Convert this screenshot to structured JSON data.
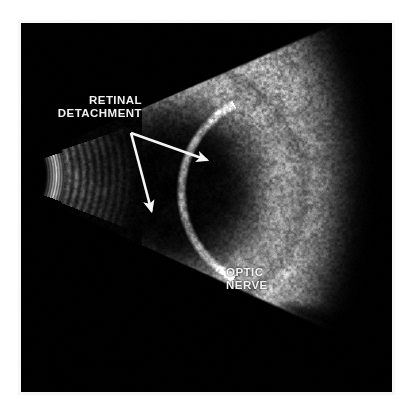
{
  "figure": {
    "type": "ocular-b-scan-ultrasound",
    "background_color": "#ffffff",
    "panel_color": "#000000",
    "annotation_color": "#f2f2f2"
  },
  "annotations": {
    "retinal_detachment": {
      "line1": "RETINAL",
      "line2": "DETACHMENT",
      "text": "RETINAL\nDETACHMENT",
      "align": "right"
    },
    "optic_nerve": {
      "line1": "OPTIC",
      "line2": "NERVE",
      "text": "OPTIC\nNERVE",
      "align": "left"
    }
  },
  "arrows": [
    {
      "name": "arrow-to-detached-retina-superior",
      "from_x": 110,
      "from_y": 110,
      "to_x": 188,
      "to_y": 138,
      "color": "#f5f5f5"
    },
    {
      "name": "arrow-to-detached-retina-inferior",
      "from_x": 110,
      "from_y": 110,
      "to_x": 131,
      "to_y": 190,
      "color": "#f5f5f5"
    }
  ],
  "scan_regions": [
    {
      "name": "probe-cornea-arc",
      "label": "bright anterior corneal arc"
    },
    {
      "name": "anterior-segment",
      "label": "anterior segment echoes"
    },
    {
      "name": "vitreous-cavity",
      "label": "anechoic vitreous cavity"
    },
    {
      "name": "detached-retina-membrane",
      "label": "thin hyperechoic detached retinal membrane"
    },
    {
      "name": "posterior-globe-wall",
      "label": "posterior globe wall"
    },
    {
      "name": "retrobulbar-fat",
      "label": "echogenic retrobulbar orbital fat"
    },
    {
      "name": "optic-nerve-shadow",
      "label": "hypoechoic optic nerve band"
    }
  ]
}
